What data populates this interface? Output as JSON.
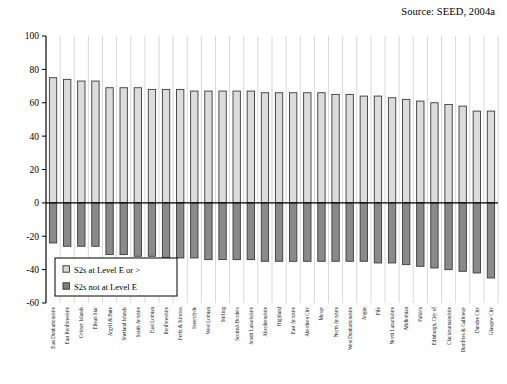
{
  "source_note": "Source: SEED, 2004a",
  "legend": {
    "position": "inside-bottom-left",
    "items": [
      {
        "label": "S2s at Level E or >",
        "swatch": "light",
        "color": "#d9d9d9"
      },
      {
        "label": "S2s not at Level E",
        "swatch": "dark",
        "color": "#808080"
      }
    ]
  },
  "axis": {
    "y_ticks": [
      "100",
      "80",
      "60",
      "40",
      "20",
      "0",
      "-20",
      "-40",
      "-60"
    ]
  },
  "colors": {
    "positive_bar": "#dcdcdc",
    "negative_bar": "#8a8a8a",
    "bar_outline": "#3a3a3a",
    "gridline": "#b9b9b9",
    "axis": "#000000"
  },
  "chart_data": {
    "type": "bar",
    "title": "",
    "subtitle": "",
    "xlabel": "",
    "ylabel": "",
    "ylim": [
      -60,
      100
    ],
    "yticks": [
      100,
      80,
      60,
      40,
      20,
      0,
      -20,
      -40,
      -60
    ],
    "grid": "vertical-category-lines",
    "stacked": "diverging-two-series",
    "legend_position": "inside-bottom-left",
    "annotations": [
      "Source: SEED, 2004a"
    ],
    "categories": [
      "East Dunbartonshire",
      "East Renfrewshire",
      "Orkney Islands",
      "Eilean Siar",
      "Argyll & Bute",
      "Shetland Islands",
      "South Ayrshire",
      "East Lothian",
      "Renfrewshire",
      "Perth & Kinross",
      "Inverclyde",
      "West Lothian",
      "Stirling",
      "Scottish Borders",
      "South Lanarkshire",
      "Aberdeenshire",
      "Highland",
      "East Ayrshire",
      "Aberdeen City",
      "Moray",
      "North Ayrshire",
      "West Dunbartonshire",
      "Angus",
      "Fife",
      "North Lanarkshire",
      "Midlothian",
      "Falkirk",
      "Edinburgh, City of",
      "Clackmannanshire",
      "Dumfries & Galloway",
      "Dundee City",
      "Glasgow City"
    ],
    "series": [
      {
        "name": "S2s at Level E or >",
        "values": [
          75,
          74,
          73,
          73,
          69,
          69,
          69,
          68,
          68,
          68,
          67,
          67,
          67,
          67,
          67,
          66,
          66,
          66,
          66,
          66,
          65,
          65,
          64,
          64,
          63,
          62,
          61,
          60,
          59,
          58,
          55,
          55
        ]
      },
      {
        "name": "S2s not at Level E",
        "values": [
          -24,
          -26,
          -26,
          -26,
          -31,
          -31,
          -32,
          -32,
          -33,
          -33,
          -33,
          -34,
          -34,
          -34,
          -34,
          -35,
          -35,
          -35,
          -35,
          -35,
          -35,
          -35,
          -35,
          -36,
          -36,
          -37,
          -38,
          -39,
          -40,
          -41,
          -42,
          -45
        ]
      }
    ]
  }
}
